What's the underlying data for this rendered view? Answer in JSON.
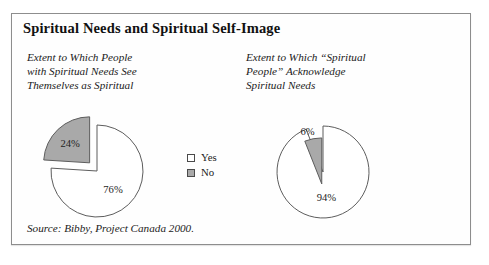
{
  "figure": {
    "title": "Spiritual Needs and Spiritual Self-Image",
    "source_note": "Source: Bibby, Project Canada 2000.",
    "border_color": "#8d8d8d",
    "background_color": "#ffffff"
  },
  "legend": {
    "items": [
      {
        "label": "Yes",
        "color": "#ffffff",
        "swatch_name": "legend-swatch-yes"
      },
      {
        "label": "No",
        "color": "#a9a9a9",
        "swatch_name": "legend-swatch-no"
      }
    ]
  },
  "panels": [
    {
      "caption": "Extent to Which People\nwith Spiritual Needs See\nThemselves as Spiritual",
      "labels": {
        "major": "76%",
        "minor": "24%"
      }
    },
    {
      "caption": "Extent to Which “Spiritual\nPeople” Acknowledge\nSpiritual Needs",
      "labels": {
        "major": "94%",
        "minor": "6%"
      }
    }
  ],
  "chart_data": [
    {
      "type": "pie",
      "title": "Extent to Which People with Spiritual Needs See Themselves as Spiritual",
      "categories": [
        "Yes",
        "No"
      ],
      "values": [
        76,
        24
      ],
      "value_labels": [
        "76%",
        "24%"
      ],
      "colors": [
        "#ffffff",
        "#a9a9a9"
      ],
      "exploded": [
        "No"
      ],
      "units": "percent",
      "legend_position": "right"
    },
    {
      "type": "pie",
      "title": "Extent to Which “Spiritual People” Acknowledge Spiritual Needs",
      "categories": [
        "Yes",
        "No"
      ],
      "values": [
        94,
        6
      ],
      "value_labels": [
        "94%",
        "6%"
      ],
      "colors": [
        "#ffffff",
        "#a9a9a9"
      ],
      "exploded": [
        "No"
      ],
      "units": "percent",
      "legend_position": "shared-left-panel"
    }
  ]
}
